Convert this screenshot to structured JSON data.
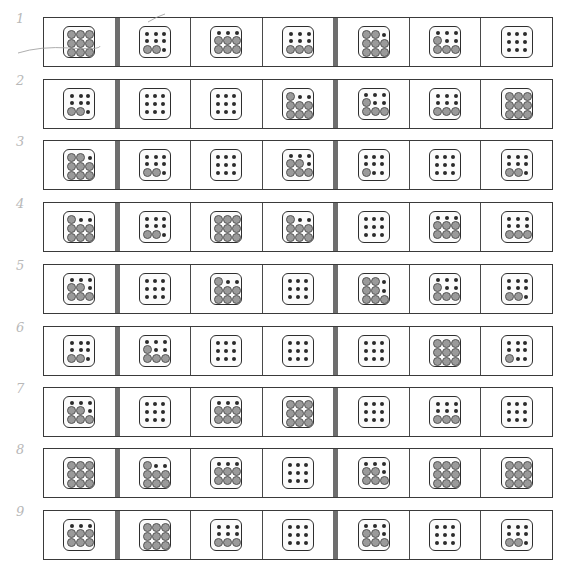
{
  "legend": {
    "d": "small dark dot",
    "g": "large gray circle"
  },
  "colors": {
    "dark_dot": "#2a2a2a",
    "gray_circle": "#9a9a9a",
    "label": "#b8b8b8",
    "divider": "#6e6e6e"
  },
  "rows": [
    {
      "label": "1",
      "cells": [
        "ggggggggg",
        "ddddddggd",
        "dddgggggg",
        "ddddddggg",
        "ggdgggggg",
        "dddgddggg",
        "ddddddddd"
      ]
    },
    {
      "label": "2",
      "cells": [
        "ddddddggd",
        "ddddddddd",
        "ddddddddd",
        "gddgggggg",
        "dddgddggg",
        "ddddddggg",
        "ggggggggg"
      ]
    },
    {
      "label": "3",
      "cells": [
        "ggdgggggg",
        "ddddddggd",
        "ddddddddd",
        "dddggdggg",
        "ddddddgdd",
        "ddddddddd",
        "ddddddggd"
      ]
    },
    {
      "label": "4",
      "cells": [
        "gddgggggg",
        "ddddddggd",
        "ggggggggg",
        "gddgggggg",
        "ddddddddd",
        "dddgggggg",
        "ddddddggg"
      ]
    },
    {
      "label": "5",
      "cells": [
        "dddggdggg",
        "ddddddddd",
        "gddgggggg",
        "ddddddddd",
        "ggdggdggg",
        "dddgddggg",
        "ddddddggd"
      ]
    },
    {
      "label": "6",
      "cells": [
        "ddddddggd",
        "dddgddggg",
        "ddddddddd",
        "ddddddddd",
        "ddddddddd",
        "ggggggggg",
        "ddddddgdd"
      ]
    },
    {
      "label": "7",
      "cells": [
        "dddggdggg",
        "ddddddddd",
        "dddgggggg",
        "ggggggggg",
        "ddddddddd",
        "ddddddggg",
        "ddddddddd"
      ]
    },
    {
      "label": "8",
      "cells": [
        "ggggggggg",
        "gddgggggg",
        "dddgggggg",
        "ddddddddd",
        "dddggdggg",
        "ggggggggg",
        "ggggggggg"
      ]
    },
    {
      "label": "9",
      "cells": [
        "dddgggggg",
        "ggggggggg",
        "ddddddggg",
        "ddddddddd",
        "dddggdggg",
        "ddddddddd",
        "ddddddggd"
      ]
    }
  ]
}
